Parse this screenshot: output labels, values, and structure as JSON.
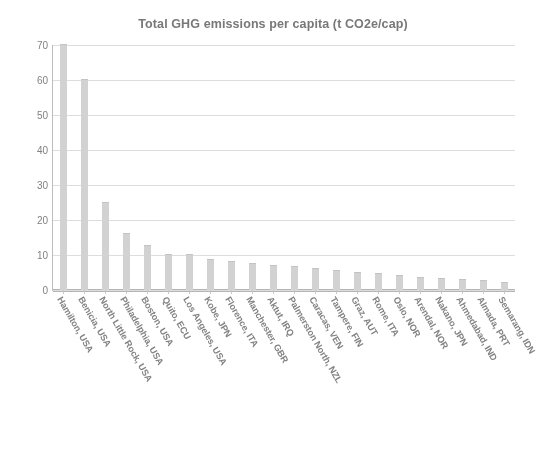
{
  "chart_data": {
    "type": "bar",
    "title": "Total GHG emissions per capita (t CO2e/cap)",
    "xlabel": "",
    "ylabel": "",
    "ylim": [
      0,
      70
    ],
    "yticks": [
      0,
      10,
      20,
      30,
      40,
      50,
      60,
      70
    ],
    "grid": true,
    "legend": "none",
    "bar_color": "#d6d6d6",
    "categories": [
      "Hamilton, USA",
      "Benicia, USA",
      "North Little Rock, USA",
      "Philadelphia, USA",
      "Boston, USA",
      "Quito, ECU",
      "Los Angeles, USA",
      "Kobe, JPN",
      "Florence, ITA",
      "Manchester, GBR",
      "Aktut, IRQ",
      "Palmerston North, NZL",
      "Caracas, VEN",
      "Tampere, FIN",
      "Graz, AUT",
      "Rome, ITA",
      "Oslo, NOR",
      "Arendal, NOR",
      "Nakano, JPN",
      "Ahmedabad, IND",
      "Almada, PRT",
      "Semarang, IDN"
    ],
    "values": [
      70,
      60,
      25,
      16,
      12.5,
      10,
      10,
      8.5,
      8,
      7.5,
      7,
      6.5,
      6,
      5.5,
      5,
      4.5,
      4,
      3.5,
      3.2,
      3,
      2.5,
      2
    ]
  }
}
